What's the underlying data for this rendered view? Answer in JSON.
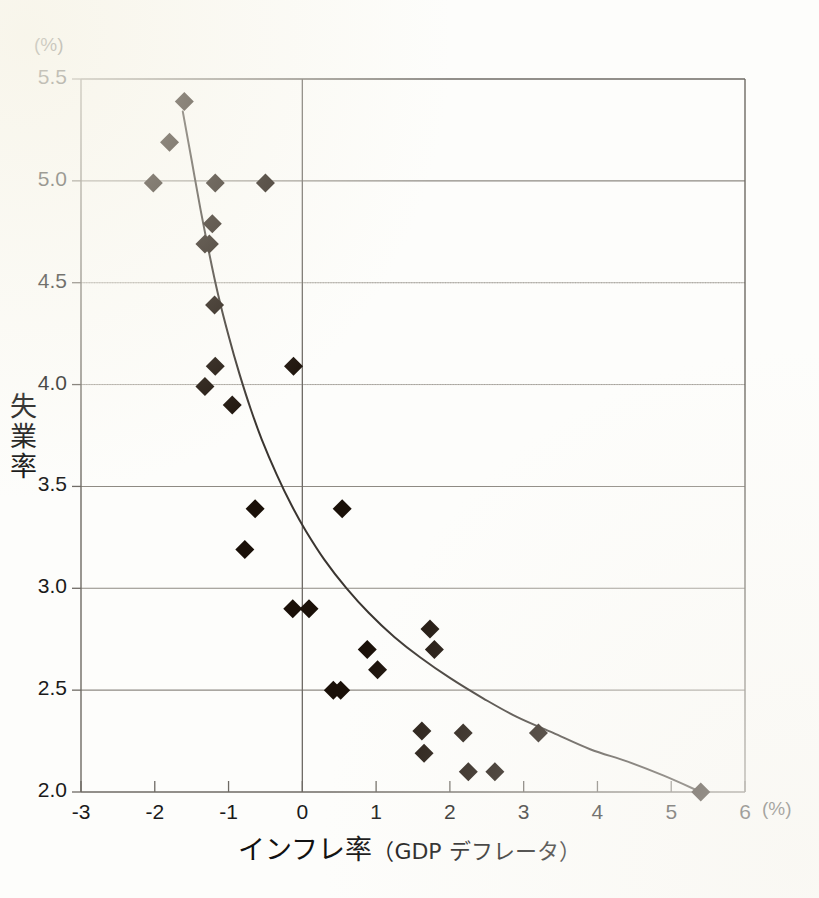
{
  "axes": {
    "y_unit_label": "(%)",
    "y_axis_title": "失業率",
    "y_axis_title_chars": [
      "失",
      "業",
      "率"
    ],
    "x_axis_title_main": "インフレ率",
    "x_axis_title_sub": "（GDP デフレータ）",
    "x_unit_label": "(%)",
    "y_ticks": [
      "2.0",
      "2.5",
      "3.0",
      "3.5",
      "4.0",
      "4.5",
      "5.0",
      "5.5"
    ],
    "x_ticks": [
      "-3",
      "-2",
      "-1",
      "0",
      "1",
      "2",
      "3",
      "4",
      "5",
      "6"
    ]
  },
  "chart_data": {
    "type": "scatter",
    "title": "",
    "xlabel": "インフレ率（GDP デフレータ）",
    "ylabel": "失業率",
    "xlim": [
      -3,
      6
    ],
    "ylim": [
      2.0,
      5.5
    ],
    "x_unit": "%",
    "y_unit": "%",
    "grid": true,
    "legend": "none",
    "marker": "diamond",
    "marker_color": "#1a1008",
    "series": [
      {
        "name": "失業率 vs インフレ率",
        "points": [
          [
            -2.02,
            4.99
          ],
          [
            -1.8,
            5.19
          ],
          [
            -1.6,
            5.39
          ],
          [
            -1.32,
            4.69
          ],
          [
            -1.26,
            4.69
          ],
          [
            -1.22,
            4.79
          ],
          [
            -1.18,
            4.99
          ],
          [
            -1.19,
            4.39
          ],
          [
            -1.18,
            4.09
          ],
          [
            -1.32,
            3.99
          ],
          [
            -0.95,
            3.9
          ],
          [
            -0.78,
            3.19
          ],
          [
            -0.64,
            3.39
          ],
          [
            -0.5,
            4.99
          ],
          [
            -0.12,
            4.09
          ],
          [
            -0.13,
            2.9
          ],
          [
            0.09,
            2.9
          ],
          [
            0.42,
            2.5
          ],
          [
            0.52,
            2.5
          ],
          [
            0.54,
            3.39
          ],
          [
            0.88,
            2.7
          ],
          [
            1.02,
            2.6
          ],
          [
            1.62,
            2.3
          ],
          [
            1.65,
            2.19
          ],
          [
            1.73,
            2.8
          ],
          [
            1.79,
            2.7
          ],
          [
            2.18,
            2.29
          ],
          [
            2.25,
            2.1
          ],
          [
            2.61,
            2.1
          ],
          [
            3.2,
            2.29
          ],
          [
            5.4,
            2.0
          ]
        ]
      }
    ],
    "fit_curve": {
      "name": "trend",
      "style": "solid",
      "color": "#3a3530",
      "points": [
        [
          -1.62,
          5.34
        ],
        [
          -1.5,
          5.1
        ],
        [
          -1.38,
          4.86
        ],
        [
          -1.26,
          4.64
        ],
        [
          -1.14,
          4.44
        ],
        [
          -1.0,
          4.24
        ],
        [
          -0.85,
          4.05
        ],
        [
          -0.7,
          3.88
        ],
        [
          -0.55,
          3.73
        ],
        [
          -0.35,
          3.56
        ],
        [
          -0.15,
          3.41
        ],
        [
          0.05,
          3.28
        ],
        [
          0.3,
          3.14
        ],
        [
          0.6,
          3.0
        ],
        [
          0.9,
          2.88
        ],
        [
          1.25,
          2.76
        ],
        [
          1.6,
          2.66
        ],
        [
          2.0,
          2.56
        ],
        [
          2.45,
          2.46
        ],
        [
          2.9,
          2.37
        ],
        [
          3.4,
          2.29
        ],
        [
          3.9,
          2.21
        ],
        [
          4.4,
          2.15
        ],
        [
          4.9,
          2.08
        ],
        [
          5.4,
          2.0
        ]
      ]
    }
  }
}
